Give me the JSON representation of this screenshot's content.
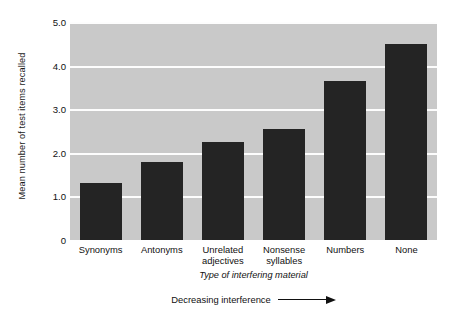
{
  "chart_data": {
    "type": "bar",
    "title": "",
    "subtitle": "",
    "categories": [
      "Synonyms",
      "Antonyms",
      "Unrelated adjectives",
      "Nonsense syllables",
      "Numbers",
      "None"
    ],
    "category_lines": [
      [
        "Synonyms"
      ],
      [
        "Antonyms"
      ],
      [
        "Unrelated",
        "adjectives"
      ],
      [
        "Nonsense",
        "syllables"
      ],
      [
        "Numbers"
      ],
      [
        "None"
      ]
    ],
    "values": [
      1.3,
      1.8,
      2.25,
      2.55,
      3.65,
      4.5
    ],
    "xlabel": "Type of interfering material",
    "ylabel": "Mean number of test items recalled",
    "ylim": [
      0,
      5.0
    ],
    "ytick_values": [
      0,
      1.0,
      2.0,
      3.0,
      4.0,
      5.0
    ],
    "ytick_labels": [
      "0",
      "1.0",
      "2.0",
      "3.0",
      "4.0",
      "5.0"
    ],
    "grid": true,
    "grid_orientation": "horizontal",
    "legend": false,
    "legend_position": "none",
    "annotation": {
      "text": "Decreasing interference",
      "arrow": "right-arrow"
    },
    "colors": {
      "bar": "#242424",
      "plot_background": "#c9c9c9",
      "gridline": "#fdfdfd",
      "text": "#111111",
      "page_background": "#ffffff"
    }
  }
}
